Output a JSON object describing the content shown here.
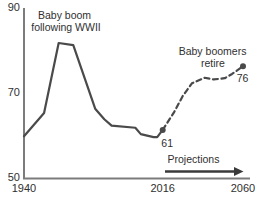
{
  "chart_data": {
    "type": "line",
    "title": "",
    "xlabel": "",
    "ylabel": "",
    "xlim": [
      1940,
      2060
    ],
    "ylim": [
      50,
      90
    ],
    "grid": false,
    "legend": "none",
    "x_ticks": [
      "1940",
      "2016",
      "2060"
    ],
    "x_tick_values": [
      1940,
      2016,
      2060
    ],
    "y_ticks": [
      "90",
      "70",
      "50"
    ],
    "y_tick_values": [
      90,
      70,
      50
    ],
    "series": [
      {
        "name": "historical",
        "style": "solid",
        "points": [
          [
            1940,
            59.5
          ],
          [
            1949,
            64
          ],
          [
            1951,
            65
          ],
          [
            1959,
            81.5
          ],
          [
            1967,
            81
          ],
          [
            1979,
            66
          ],
          [
            1984,
            63.5
          ],
          [
            1988,
            62
          ],
          [
            2001,
            61.5
          ],
          [
            2004,
            60
          ],
          [
            2011,
            59.3
          ],
          [
            2013,
            59.3
          ],
          [
            2016,
            61
          ]
        ]
      },
      {
        "name": "projection",
        "style": "dashed",
        "points": [
          [
            2016,
            61
          ],
          [
            2022,
            65
          ],
          [
            2027,
            69
          ],
          [
            2032,
            72
          ],
          [
            2039,
            73.3
          ],
          [
            2044,
            72.9
          ],
          [
            2050,
            73.2
          ],
          [
            2054,
            74.2
          ],
          [
            2060,
            76
          ]
        ]
      }
    ],
    "point_markers": [
      {
        "year": 2016,
        "value": 61,
        "label": "61"
      },
      {
        "year": 2060,
        "value": 76,
        "label": "76"
      }
    ],
    "annotations": {
      "baby_boom": {
        "line1": "Baby boom",
        "line2": "following WWII"
      },
      "boomers_retire": {
        "line1": "Baby boomers",
        "line2": "retire"
      },
      "projections": {
        "label": "Projections"
      }
    }
  },
  "colors": {
    "line": "#4a4a4a",
    "axis": "#7c7c7c",
    "text": "#303030",
    "arrow": "#3a3a3a",
    "background": "#ffffff"
  }
}
